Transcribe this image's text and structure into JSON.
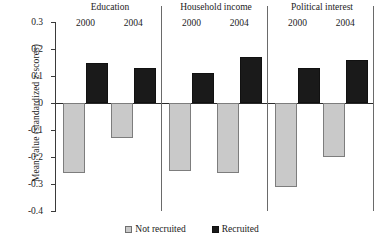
{
  "chart_data": {
    "type": "bar",
    "title": "",
    "xlabel": "",
    "ylabel": "Mean value (standardized z-scores)",
    "ylim": [
      -0.4,
      0.3
    ],
    "ytick_labels": [
      "0.3",
      "0.2",
      "0.1",
      "0",
      "-0.1",
      "-0.2",
      "-0.3",
      "-0.4"
    ],
    "ytick_values": [
      0.3,
      0.2,
      0.1,
      0,
      -0.1,
      -0.2,
      -0.3,
      -0.4
    ],
    "grid": false,
    "legend_position": "bottom",
    "groups": [
      "Education",
      "Household income",
      "Political interest"
    ],
    "categories": [
      "2000",
      "2004",
      "2000",
      "2004",
      "2000",
      "2004"
    ],
    "series": [
      {
        "name": "Not recruited",
        "color": "#c9c9c9",
        "values": [
          -0.26,
          -0.13,
          -0.25,
          -0.26,
          -0.31,
          -0.2
        ]
      },
      {
        "name": "Recruited",
        "color": "#1a1a1a",
        "values": [
          0.15,
          0.13,
          0.11,
          0.17,
          0.13,
          0.16
        ]
      }
    ],
    "bars": [
      {
        "group": "Education",
        "year": "2000",
        "series": "Not recruited",
        "value": -0.26
      },
      {
        "group": "Education",
        "year": "2000",
        "series": "Recruited",
        "value": 0.15
      },
      {
        "group": "Education",
        "year": "2004",
        "series": "Not recruited",
        "value": -0.13
      },
      {
        "group": "Education",
        "year": "2004",
        "series": "Recruited",
        "value": 0.13
      },
      {
        "group": "Household income",
        "year": "2000",
        "series": "Not recruited",
        "value": -0.25
      },
      {
        "group": "Household income",
        "year": "2000",
        "series": "Recruited",
        "value": 0.11
      },
      {
        "group": "Household income",
        "year": "2004",
        "series": "Not recruited",
        "value": -0.26
      },
      {
        "group": "Household income",
        "year": "2004",
        "series": "Recruited",
        "value": 0.17
      },
      {
        "group": "Political interest",
        "year": "2000",
        "series": "Not recruited",
        "value": -0.31
      },
      {
        "group": "Political interest",
        "year": "2000",
        "series": "Recruited",
        "value": 0.13
      },
      {
        "group": "Political interest",
        "year": "2004",
        "series": "Not recruited",
        "value": -0.2
      },
      {
        "group": "Political interest",
        "year": "2004",
        "series": "Recruited",
        "value": 0.16
      }
    ],
    "legend": [
      {
        "label": "Not recruited",
        "color": "#c9c9c9"
      },
      {
        "label": "Recruited",
        "color": "#1a1a1a"
      }
    ]
  }
}
